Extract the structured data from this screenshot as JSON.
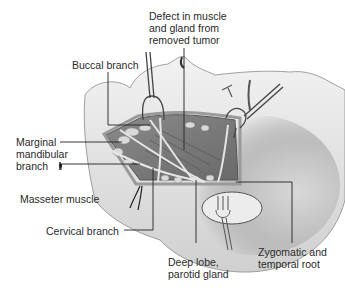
{
  "figure": {
    "labels": {
      "defect": "Defect in muscle\nand gland from\nremoved tumor",
      "buccal": "Buccal branch",
      "marginal": "Marginal\nmandibular\nbranch",
      "masseter": "Masseter muscle",
      "cervical": "Cervical branch",
      "deep_lobe": "Deep lobe,\nparotid gland",
      "zygomatic": "Zygomatic and\ntemporal root"
    }
  }
}
